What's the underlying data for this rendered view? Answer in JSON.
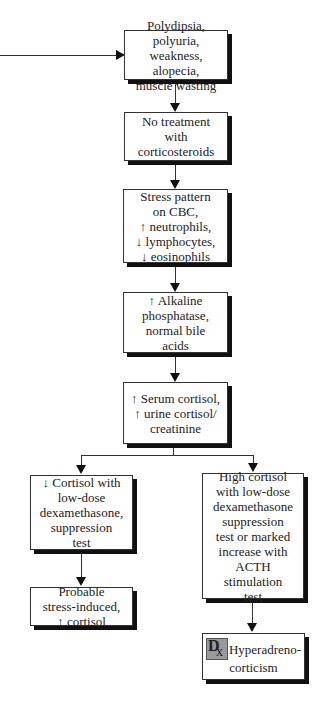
{
  "diagram": {
    "type": "flowchart",
    "nodes": [
      {
        "id": "n1",
        "text": "Polydipsia, polyuria,\nweakness, alopecia,\nmuscle wasting"
      },
      {
        "id": "n2",
        "text": "No treatment\nwith\ncorticosteroids"
      },
      {
        "id": "n3",
        "text": "Stress pattern\non CBC,\n↑ neutrophils,\n↓ lymphocytes,\n↓ eosinophils"
      },
      {
        "id": "n4",
        "text": "↑ Alkaline\nphosphatase,\nnormal bile\nacids"
      },
      {
        "id": "n5",
        "text": "↑ Serum cortisol,\n↑ urine cortisol/\ncreatinine"
      },
      {
        "id": "n6",
        "text": "↓ Cortisol with\nlow-dose\ndexamethasone,\nsuppression\ntest"
      },
      {
        "id": "n7",
        "text": "Probable\nstress-induced,\n↑ cortisol"
      },
      {
        "id": "n8",
        "text": "High cortisol\nwith low-dose\ndexamethasone\nsuppression\ntest or marked\nincrease with\nACTH stimulation\ntest"
      },
      {
        "id": "n9",
        "icon": "dx-icon",
        "icon_letters": [
          "D",
          "x"
        ],
        "text_line1": "Hyperadreno-",
        "text_line2": "corticism"
      }
    ],
    "edges": [
      {
        "from": "incoming-left",
        "to": "n1"
      },
      {
        "from": "n1",
        "to": "n2"
      },
      {
        "from": "n2",
        "to": "n3"
      },
      {
        "from": "n3",
        "to": "n4"
      },
      {
        "from": "n4",
        "to": "n5"
      },
      {
        "from": "n5",
        "to": "n6"
      },
      {
        "from": "n5",
        "to": "n8"
      },
      {
        "from": "n6",
        "to": "n7"
      },
      {
        "from": "n8",
        "to": "n9"
      }
    ]
  }
}
